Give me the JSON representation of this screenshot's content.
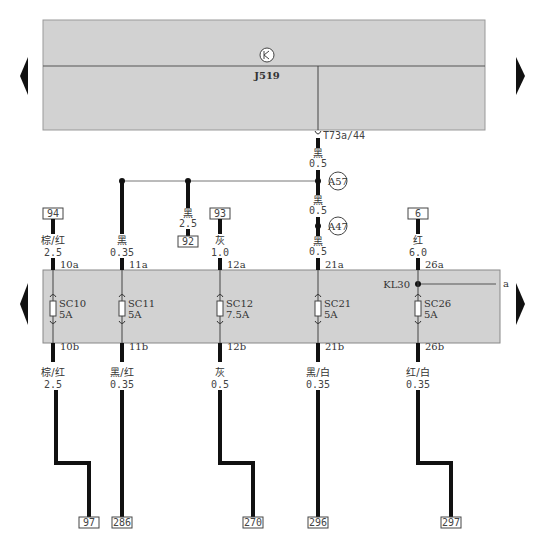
{
  "module": {
    "name": "J519",
    "box_color": "#d2d2d2",
    "connector": "T73a/44"
  },
  "wire_top": {
    "color": "黑",
    "size": "0.5"
  },
  "splices": [
    {
      "id": "A57",
      "wire_below": {
        "color": "黑",
        "size": "0.5"
      }
    },
    {
      "id": "A47",
      "wire_below": {
        "color": "黑",
        "size": "0.5"
      }
    }
  ],
  "branch_92": {
    "color": "黑",
    "size": "2.5",
    "ref": "92"
  },
  "fusebox": {
    "box_color": "#d2d2d2",
    "kl30_label": "KL30",
    "kl30_ref": "a",
    "fuses": [
      {
        "id": "SC10",
        "rating": "5A",
        "in_ref": "94",
        "in_color": "棕/红",
        "in_size": "2.5",
        "pin_a": "10a",
        "pin_b": "10b",
        "out_color": "棕/红",
        "out_size": "2.5",
        "out_ref": "97"
      },
      {
        "id": "SC11",
        "rating": "5A",
        "in_ref": "",
        "in_color": "黑",
        "in_size": "0.35",
        "pin_a": "11a",
        "pin_b": "11b",
        "out_color": "黑/红",
        "out_size": "0.35",
        "out_ref": "286"
      },
      {
        "id": "SC12",
        "rating": "7.5A",
        "in_ref": "93",
        "in_color": "灰",
        "in_size": "1.0",
        "pin_a": "12a",
        "pin_b": "12b",
        "out_color": "灰",
        "out_size": "0.5",
        "out_ref": "270"
      },
      {
        "id": "SC21",
        "rating": "5A",
        "in_ref": "",
        "in_color": "黑",
        "in_size": "0.5",
        "pin_a": "21a",
        "pin_b": "21b",
        "out_color": "黑/白",
        "out_size": "0.35",
        "out_ref": "296"
      },
      {
        "id": "SC26",
        "rating": "5A",
        "in_ref": "6",
        "in_color": "红",
        "in_size": "6.0",
        "pin_a": "26a",
        "pin_b": "26b",
        "out_color": "红/白",
        "out_size": "0.35",
        "out_ref": "297"
      }
    ]
  },
  "nav": {
    "left_arrow": "◀",
    "right_arrow": "▶"
  }
}
